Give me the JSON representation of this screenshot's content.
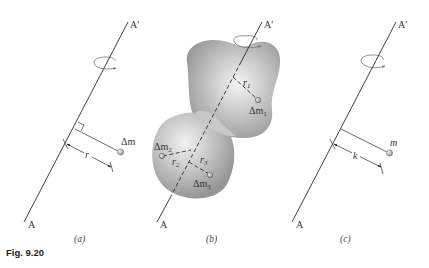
{
  "figure": {
    "caption": "Fig. 9.20",
    "panels": [
      {
        "id": "a",
        "label": "(a)",
        "axis_top_label": "A′",
        "axis_bottom_label": "A",
        "mass_label": "Δm",
        "distance_label": "r"
      },
      {
        "id": "b",
        "label": "(b)",
        "axis_top_label": "A′",
        "axis_bottom_label": "A",
        "masses": [
          {
            "label": "Δm",
            "sub": "1",
            "distance_label": "r",
            "distance_sub": "1"
          },
          {
            "label": "Δm",
            "sub": "2",
            "distance_label": "r",
            "distance_sub": "2"
          },
          {
            "label": "Δm",
            "sub": "3",
            "distance_label": "r",
            "distance_sub": "3"
          }
        ]
      },
      {
        "id": "c",
        "label": "(c)",
        "axis_top_label": "A′",
        "axis_bottom_label": "A",
        "mass_label": "m",
        "distance_label": "k"
      }
    ],
    "colors": {
      "line": "#2a2a2a",
      "body_fill": "#a9a9a9",
      "body_highlight": "#f2f2f2",
      "mass_point": "#9a9a9a"
    }
  }
}
